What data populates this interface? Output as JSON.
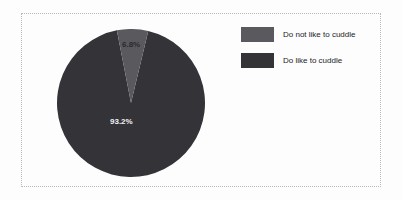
{
  "chart_data": {
    "type": "pie",
    "title": "",
    "categories": [
      "Do not like to cuddle",
      "Do like to cuddle"
    ],
    "values": [
      6.8,
      93.2
    ],
    "value_labels": [
      "6.8%",
      "93.2%"
    ],
    "colors": [
      "#5a5a5e",
      "#333338"
    ],
    "legend_position": "right",
    "grid": false,
    "slices": [
      {
        "label": "Do not like to cuddle",
        "value": 6.8,
        "display": "6.8%",
        "color": "#5a5a5e",
        "label_color": "#2a2a2d"
      },
      {
        "label": "Do like to cuddle",
        "value": 93.2,
        "display": "93.2%",
        "color": "#333338",
        "label_color": "#f2f2f2"
      }
    ]
  },
  "legend": {
    "items": [
      {
        "label": "Do not like to cuddle",
        "color": "#5a5a5e"
      },
      {
        "label": "Do like to cuddle",
        "color": "#333338"
      }
    ]
  },
  "frame": {
    "border_color": "#b9b9b9",
    "background": "#fdfdfd"
  }
}
